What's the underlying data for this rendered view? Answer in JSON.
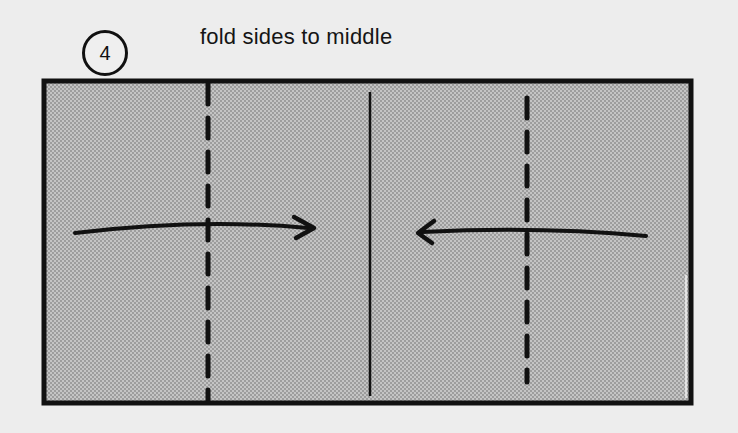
{
  "step": {
    "number": "4",
    "caption": "fold sides to middle"
  },
  "diagram": {
    "paper": {
      "x": 44,
      "y": 81,
      "width": 647,
      "height": 322,
      "fill": "#b9b9b9",
      "stroke": "#111111"
    },
    "center_line_x": 370,
    "fold_lines": [
      {
        "name": "left-valley-fold",
        "x": 208,
        "style": "dashed"
      },
      {
        "name": "right-valley-fold",
        "x": 527,
        "style": "dashed"
      }
    ],
    "arrows": [
      {
        "name": "left-side-fold-arrow",
        "direction": "right",
        "from_x": 75,
        "to_x": 315,
        "y": 232
      },
      {
        "name": "right-side-fold-arrow",
        "direction": "left",
        "from_x": 646,
        "to_x": 416,
        "y": 234
      }
    ]
  }
}
